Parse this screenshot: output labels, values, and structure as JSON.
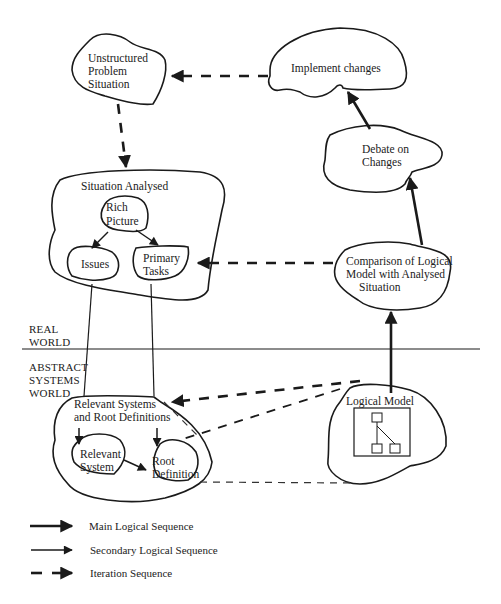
{
  "diagram": {
    "type": "soft-systems-methodology",
    "nodes": {
      "unstructured": {
        "label_lines": [
          "Unstructured",
          "Problem",
          "Situation"
        ]
      },
      "implement": {
        "label": "Implement changes"
      },
      "debate": {
        "label_lines": [
          "Debate on",
          "Changes"
        ]
      },
      "situation": {
        "label": "Situation Analysed"
      },
      "rich_picture": {
        "label_lines": [
          "Rich",
          "Picture"
        ]
      },
      "issues": {
        "label": "Issues"
      },
      "primary_tasks": {
        "label_lines": [
          "Primary",
          "Tasks"
        ]
      },
      "comparison": {
        "label_lines": [
          "Comparison of Logical",
          "Model with Analysed",
          "Situation"
        ]
      },
      "relevant_systems": {
        "label_lines": [
          "Relevant Systems",
          "and Root Definitions"
        ]
      },
      "relevant_system": {
        "label_lines": [
          "Relevant",
          "System"
        ]
      },
      "root_definition": {
        "label_lines": [
          "Root",
          "Definition"
        ]
      },
      "logical_model": {
        "label": "Logical Model"
      }
    },
    "zones": {
      "real_world": [
        "REAL",
        "WORLD"
      ],
      "abstract_world": [
        "ABSTRACT",
        "SYSTEMS",
        "WORLD"
      ]
    },
    "edges": [
      {
        "from": "implement",
        "to": "unstructured",
        "style": "iteration"
      },
      {
        "from": "unstructured",
        "to": "situation",
        "style": "iteration"
      },
      {
        "from": "rich_picture",
        "to": "issues",
        "style": "secondary"
      },
      {
        "from": "rich_picture",
        "to": "primary_tasks",
        "style": "secondary"
      },
      {
        "from": "comparison",
        "to": "situation",
        "style": "iteration"
      },
      {
        "from": "logical_model",
        "to": "comparison",
        "style": "main"
      },
      {
        "from": "comparison",
        "to": "debate",
        "style": "main"
      },
      {
        "from": "debate",
        "to": "implement",
        "style": "main"
      },
      {
        "from": "logical_model",
        "to": "relevant_systems",
        "style": "iteration"
      },
      {
        "from": "relevant_system",
        "to": "root_definition",
        "style": "secondary"
      }
    ]
  },
  "legend": {
    "items": [
      {
        "label": "Main Logical Sequence",
        "style": "main"
      },
      {
        "label": "Secondary Logical Sequence",
        "style": "secondary"
      },
      {
        "label": "Iteration Sequence",
        "style": "iteration"
      }
    ]
  }
}
